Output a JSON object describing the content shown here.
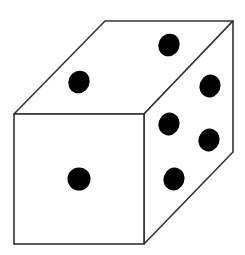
{
  "diagram": {
    "type": "dice-3d",
    "colors": {
      "background": "#ffffff",
      "face_fill": "#ffffff",
      "edge": "#333333",
      "pip": "#000000"
    },
    "faces": {
      "front": {
        "pips": 1
      },
      "top": {
        "pips": 2
      },
      "right": {
        "pips": 5
      }
    }
  }
}
